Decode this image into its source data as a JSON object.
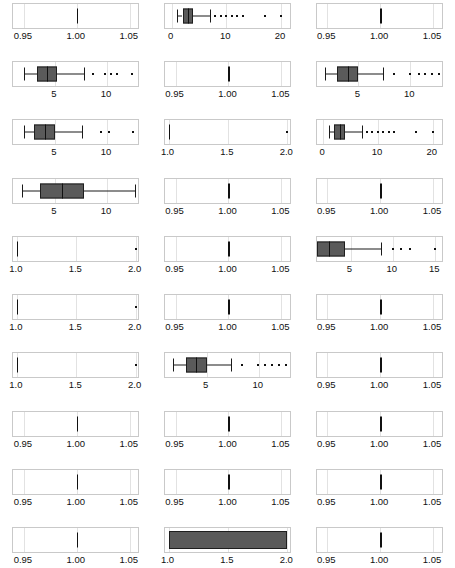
{
  "figure": {
    "type": "small-multiples-boxplot-grid",
    "columns": 3,
    "rows": 9,
    "box_fill_color": "#5a5a5a",
    "box_outline_color": "#1e1e1e",
    "panel_border_color": "#c9c9c9",
    "gridline_color": "#e2e2e2",
    "background_color": "#ffffff"
  },
  "chart_data": {
    "type": "box",
    "title": "",
    "xlabel": "",
    "ylabel": "",
    "grid": true,
    "legend": "none",
    "panels": [
      {
        "name": "bibo:authorList",
        "xlim": [
          0.94,
          1.06
        ],
        "ticks": [
          0.95,
          1.0,
          1.05
        ],
        "tick_labels": [
          "0.95",
          "1.00",
          "1.05"
        ],
        "degenerate": true,
        "min": 1.0,
        "q1": 1.0,
        "median": 1.0,
        "q3": 1.0,
        "max": 1.0,
        "outliers": []
      },
      {
        "name": "dce:creator",
        "xlim": [
          -1.2,
          22
        ],
        "ticks": [
          0,
          10,
          20
        ],
        "tick_labels": [
          "0",
          "10",
          "20"
        ],
        "degenerate": false,
        "min": 1,
        "q1": 2,
        "median": 3,
        "q3": 4,
        "max": 7,
        "outliers": [
          8,
          9,
          10,
          11,
          12,
          13,
          17,
          20
        ]
      },
      {
        "name": "dce:identifier",
        "xlim": [
          0.94,
          1.06
        ],
        "ticks": [
          0.95,
          1.0,
          1.05
        ],
        "tick_labels": [
          "0.95",
          "1.00",
          "1.05"
        ],
        "degenerate": true,
        "min": 1.0,
        "q1": 1.0,
        "median": 1.0,
        "q3": 1.0,
        "max": 1.0,
        "outliers": []
      },
      {
        "name": "dce:subject",
        "xlim": [
          1.0,
          13.2
        ],
        "ticks": [
          5,
          10
        ],
        "tick_labels": [
          "5",
          "10"
        ],
        "degenerate": false,
        "min": 2,
        "q1": 3.3,
        "median": 4.2,
        "q3": 5.2,
        "max": 7.8,
        "outliers": [
          8.7,
          9.8,
          10.4,
          11.0,
          12.4
        ]
      },
      {
        "name": "dce:title",
        "xlim": [
          0.94,
          1.06
        ],
        "ticks": [
          0.95,
          1.0,
          1.05
        ],
        "tick_labels": [
          "0.95",
          "1.00",
          "1.05"
        ],
        "degenerate": true,
        "min": 1.0,
        "q1": 1.0,
        "median": 1.0,
        "q3": 1.0,
        "max": 1.0,
        "outliers": []
      },
      {
        "name": "dcterms:creator",
        "xlim": [
          1.0,
          13.2
        ],
        "ticks": [
          5,
          10
        ],
        "tick_labels": [
          "5",
          "10"
        ],
        "degenerate": false,
        "min": 1.8,
        "q1": 3.0,
        "median": 4.0,
        "q3": 5.0,
        "max": 7.4,
        "outliers": [
          8.4,
          10.0,
          10.8,
          11.4,
          12.1,
          12.8
        ]
      },
      {
        "name": "dcterms:subject",
        "xlim": [
          1.0,
          13.2
        ],
        "ticks": [
          5,
          10
        ],
        "tick_labels": [
          "5",
          "10"
        ],
        "degenerate": false,
        "min": 2.0,
        "q1": 3.0,
        "median": 4.0,
        "q3": 5.0,
        "max": 7.6,
        "outliers": [
          9.4,
          10.2,
          12.5
        ]
      },
      {
        "name": "dcterms:title",
        "xlim": [
          0.97,
          2.04
        ],
        "ticks": [
          1.0,
          1.5,
          2.0
        ],
        "tick_labels": [
          "1.0",
          "1.5",
          "2.0"
        ],
        "degenerate": true,
        "min": 1.0,
        "q1": 1.0,
        "median": 1.0,
        "q3": 1.0,
        "max": 1.0,
        "outliers": [
          2.0
        ]
      },
      {
        "name": "foaf:maker",
        "xlim": [
          -1.2,
          22
        ],
        "ticks": [
          0,
          10,
          20
        ],
        "tick_labels": [
          "0",
          "10",
          "20"
        ],
        "degenerate": false,
        "min": 1,
        "q1": 2,
        "median": 3,
        "q3": 4,
        "max": 7,
        "outliers": [
          8,
          9,
          10,
          11,
          12,
          13,
          17,
          20
        ]
      },
      {
        "name": "foaf:topic",
        "xlim": [
          1.0,
          13.2
        ],
        "ticks": [
          5,
          10
        ],
        "tick_labels": [
          "5",
          "10"
        ],
        "degenerate": false,
        "min": 1.8,
        "q1": 3.6,
        "median": 5.7,
        "q3": 7.8,
        "max": 12.7,
        "outliers": []
      },
      {
        "name": "owl:sameAs",
        "xlim": [
          0.94,
          1.06
        ],
        "ticks": [
          0.95,
          1.0,
          1.05
        ],
        "tick_labels": [
          "0.95",
          "1.00",
          "1.05"
        ],
        "degenerate": true,
        "min": 1.0,
        "q1": 1.0,
        "median": 1.0,
        "q3": 1.0,
        "max": 1.0,
        "outliers": []
      },
      {
        "name": "rdf:type",
        "xlim": [
          0.94,
          1.06
        ],
        "ticks": [
          0.95,
          1.0,
          1.05
        ],
        "tick_labels": [
          "0.95",
          "1.00",
          "1.05"
        ],
        "degenerate": true,
        "min": 1.0,
        "q1": 1.0,
        "median": 1.0,
        "q3": 1.0,
        "max": 1.0,
        "outliers": []
      },
      {
        "name": "rdfs:label",
        "xlim": [
          0.97,
          2.04
        ],
        "ticks": [
          1.0,
          1.5,
          2.0
        ],
        "tick_labels": [
          "1.0",
          "1.5",
          "2.0"
        ],
        "degenerate": true,
        "min": 1.0,
        "q1": 1.0,
        "median": 1.0,
        "q3": 1.0,
        "max": 1.0,
        "outliers": [
          2.0
        ]
      },
      {
        "name": "swc:hasRelatedEvent",
        "xlim": [
          0.94,
          1.06
        ],
        "ticks": [
          0.95,
          1.0,
          1.05
        ],
        "tick_labels": [
          "0.95",
          "1.00",
          "1.05"
        ],
        "degenerate": true,
        "min": 1.0,
        "q1": 1.0,
        "median": 1.0,
        "q3": 1.0,
        "max": 1.0,
        "outliers": []
      },
      {
        "name": "swc:hasTopic",
        "xlim": [
          1.0,
          16.0
        ],
        "ticks": [
          5,
          10,
          15
        ],
        "tick_labels": [
          "5",
          "10",
          "15"
        ],
        "degenerate": false,
        "min": 1.0,
        "q1": 1.0,
        "median": 2.4,
        "q3": 4.4,
        "max": 8.6,
        "outliers": [
          10.0,
          11.0,
          12.0,
          15.0
        ]
      },
      {
        "name": "swc:isPartOf",
        "xlim": [
          0.97,
          2.04
        ],
        "ticks": [
          1.0,
          1.5,
          2.0
        ],
        "tick_labels": [
          "1.0",
          "1.5",
          "2.0"
        ],
        "degenerate": true,
        "min": 1.0,
        "q1": 1.0,
        "median": 1.0,
        "q3": 1.0,
        "max": 1.0,
        "outliers": [
          2.0
        ]
      },
      {
        "name": "swc:relatedToEvent",
        "xlim": [
          0.94,
          1.06
        ],
        "ticks": [
          0.95,
          1.0,
          1.05
        ],
        "tick_labels": [
          "0.95",
          "1.00",
          "1.05"
        ],
        "degenerate": true,
        "min": 1.0,
        "q1": 1.0,
        "median": 1.0,
        "q3": 1.0,
        "max": 1.0,
        "outliers": []
      },
      {
        "name": "swrc2:authorList",
        "xlim": [
          0.94,
          1.06
        ],
        "ticks": [
          0.95,
          1.0,
          1.05
        ],
        "tick_labels": [
          "0.95",
          "1.00",
          "1.05"
        ],
        "degenerate": true,
        "min": 1.0,
        "q1": 1.0,
        "median": 1.0,
        "q3": 1.0,
        "max": 1.0,
        "outliers": []
      },
      {
        "name": "swrc:abstract",
        "xlim": [
          0.97,
          2.04
        ],
        "ticks": [
          1.0,
          1.5,
          2.0
        ],
        "tick_labels": [
          "1.0",
          "1.5",
          "2.0"
        ],
        "degenerate": true,
        "min": 1.0,
        "q1": 1.0,
        "median": 1.0,
        "q3": 1.0,
        "max": 1.0,
        "outliers": [
          2.0
        ]
      },
      {
        "name": "swrc:author",
        "xlim": [
          1.0,
          13.2
        ],
        "ticks": [
          5,
          10
        ],
        "tick_labels": [
          "5",
          "10"
        ],
        "degenerate": false,
        "min": 1.8,
        "q1": 3.0,
        "median": 4.0,
        "q3": 5.0,
        "max": 7.3,
        "outliers": [
          8.4,
          9.9,
          10.6,
          11.3,
          12.0,
          12.6
        ]
      },
      {
        "name": "swrc:idLncs",
        "xlim": [
          0.94,
          1.06
        ],
        "ticks": [
          0.95,
          1.0,
          1.05
        ],
        "tick_labels": [
          "0.95",
          "1.00",
          "1.05"
        ],
        "degenerate": true,
        "min": 1.0,
        "q1": 1.0,
        "median": 1.0,
        "q3": 1.0,
        "max": 1.0,
        "outliers": []
      },
      {
        "name": "swrc:listAuthor",
        "xlim": [
          0.94,
          1.06
        ],
        "ticks": [
          0.95,
          1.0,
          1.05
        ],
        "tick_labels": [
          "0.95",
          "1.00",
          "1.05"
        ],
        "degenerate": true,
        "min": 1.0,
        "q1": 1.0,
        "median": 1.0,
        "q3": 1.0,
        "max": 1.0,
        "outliers": []
      },
      {
        "name": "swrc:listKeyword",
        "xlim": [
          0.94,
          1.06
        ],
        "ticks": [
          0.95,
          1.0,
          1.05
        ],
        "tick_labels": [
          "0.95",
          "1.00",
          "1.05"
        ],
        "degenerate": true,
        "min": 1.0,
        "q1": 1.0,
        "median": 1.0,
        "q3": 1.0,
        "max": 1.0,
        "outliers": []
      },
      {
        "name": "swrc:month",
        "xlim": [
          0.94,
          1.06
        ],
        "ticks": [
          0.95,
          1.0,
          1.05
        ],
        "tick_labels": [
          "0.95",
          "1.00",
          "1.05"
        ],
        "degenerate": true,
        "min": 1.0,
        "q1": 1.0,
        "median": 1.0,
        "q3": 1.0,
        "max": 1.0,
        "outliers": []
      },
      {
        "name": "swrc:pages",
        "xlim": [
          0.94,
          1.06
        ],
        "ticks": [
          0.95,
          1.0,
          1.05
        ],
        "tick_labels": [
          "0.95",
          "1.00",
          "1.05"
        ],
        "degenerate": true,
        "min": 1.0,
        "q1": 1.0,
        "median": 1.0,
        "q3": 1.0,
        "max": 1.0,
        "outliers": []
      },
      {
        "name": "swrc:pdf",
        "xlim": [
          0.94,
          1.06
        ],
        "ticks": [
          0.95,
          1.0,
          1.05
        ],
        "tick_labels": [
          "0.95",
          "1.00",
          "1.05"
        ],
        "degenerate": true,
        "min": 1.0,
        "q1": 1.0,
        "median": 1.0,
        "q3": 1.0,
        "max": 1.0,
        "outliers": []
      },
      {
        "name": "swrc:spotlight",
        "xlim": [
          0.94,
          1.06
        ],
        "ticks": [
          0.95,
          1.0,
          1.05
        ],
        "tick_labels": [
          "0.95",
          "1.00",
          "1.05"
        ],
        "degenerate": true,
        "min": 1.0,
        "q1": 1.0,
        "median": 1.0,
        "q3": 1.0,
        "max": 1.0,
        "outliers": []
      },
      {
        "name": "swrc:title",
        "xlim": [
          0.94,
          1.06
        ],
        "ticks": [
          0.95,
          1.0,
          1.05
        ],
        "tick_labels": [
          "0.95",
          "1.00",
          "1.05"
        ],
        "degenerate": true,
        "min": 1.0,
        "q1": 1.0,
        "median": 1.0,
        "q3": 1.0,
        "max": 1.0,
        "outliers": []
      },
      {
        "name": "swrc:url",
        "xlim": [
          0.97,
          2.04
        ],
        "ticks": [
          1.0,
          1.5,
          2.0
        ],
        "tick_labels": [
          "1.0",
          "1.5",
          "2.0"
        ],
        "degenerate": false,
        "filled_full": true,
        "min": 1.0,
        "q1": 1.0,
        "median": 1.5,
        "q3": 2.0,
        "max": 2.0,
        "outliers": []
      },
      {
        "name": "swrc:year",
        "xlim": [
          0.94,
          1.06
        ],
        "ticks": [
          0.95,
          1.0,
          1.05
        ],
        "tick_labels": [
          "0.95",
          "1.00",
          "1.05"
        ],
        "degenerate": true,
        "min": 1.0,
        "q1": 1.0,
        "median": 1.0,
        "q3": 1.0,
        "max": 1.0,
        "outliers": []
      }
    ]
  }
}
